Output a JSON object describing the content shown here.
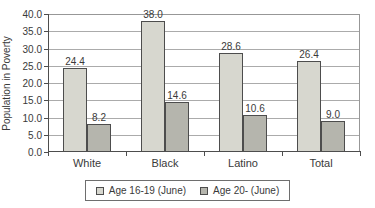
{
  "chart_data": {
    "type": "bar",
    "categories": [
      "White",
      "Black",
      "Latino",
      "Total"
    ],
    "series": [
      {
        "name": "Age 16-19 (June)",
        "values": [
          24.4,
          38.0,
          28.6,
          26.4
        ],
        "color": "#d7d7cf"
      },
      {
        "name": "Age 20- (June)",
        "values": [
          8.2,
          14.6,
          10.6,
          9.0
        ],
        "color": "#b5b5ad"
      }
    ],
    "title": "",
    "xlabel": "",
    "ylabel": "Population in Poverty",
    "ylim": [
      0,
      40
    ],
    "ytick_step": 5,
    "ytick_labels": [
      "0.0",
      "5.0",
      "10.0",
      "15.0",
      "20.0",
      "25.0",
      "30.0",
      "35.0",
      "40.0"
    ],
    "value_label_decimals": 1,
    "grid": "horizontal",
    "legend_position": "bottom",
    "colors": {
      "bar_border": "#4d4d4d",
      "gridline": "#ababab",
      "plot_border": "#979797",
      "axis": "#4d4d4d",
      "text": "#3a3a3a",
      "background": "#ffffff"
    }
  }
}
